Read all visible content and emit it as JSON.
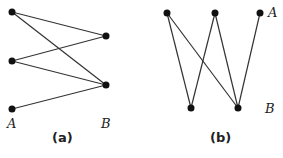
{
  "figures": [
    {
      "caption": "(a)",
      "label_A": "A",
      "label_B": "B",
      "nodes": [
        [
          12,
          12
        ],
        [
          12,
          61
        ],
        [
          12,
          109
        ],
        [
          106,
          36
        ],
        [
          106,
          85
        ]
      ],
      "edges": [
        [
          0,
          3
        ],
        [
          0,
          4
        ],
        [
          1,
          3
        ],
        [
          1,
          4
        ],
        [
          2,
          4
        ]
      ]
    },
    {
      "caption": "(b)",
      "label_A": "A",
      "label_B": "B",
      "nodes": [
        [
          167,
          13
        ],
        [
          215,
          13
        ],
        [
          260,
          13
        ],
        [
          191,
          108
        ],
        [
          238,
          108
        ]
      ],
      "edges": [
        [
          0,
          3
        ],
        [
          0,
          4
        ],
        [
          1,
          3
        ],
        [
          1,
          4
        ],
        [
          2,
          4
        ]
      ]
    }
  ],
  "colors": {
    "line": "#333333",
    "node": "#111111"
  }
}
